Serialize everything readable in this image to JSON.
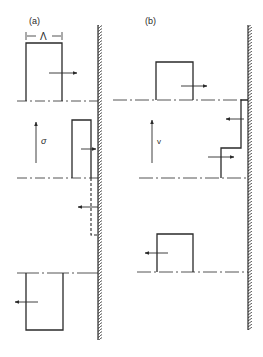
{
  "figure": {
    "panels": [
      {
        "id": "a",
        "label": "(a)",
        "dimension_label": "Λ",
        "velocity_label": "σ",
        "states": [
          {
            "shape": "rectangle",
            "arrow": "right",
            "position": "top"
          },
          {
            "shape": "narrow-rectangle-at-wall",
            "arrow": "right",
            "reflected": "dashed",
            "reflected_arrow": "left",
            "position": "middle"
          },
          {
            "shape": "rectangle",
            "arrow": "left",
            "position": "bottom"
          }
        ]
      },
      {
        "id": "b",
        "label": "(b)",
        "velocity_label": "v",
        "states": [
          {
            "shape": "square",
            "arrow": "right",
            "position": "top"
          },
          {
            "shape": "step-profile-at-wall",
            "arrows": [
              "left",
              "right"
            ],
            "position": "middle"
          },
          {
            "shape": "square",
            "arrow": "left",
            "position": "bottom"
          }
        ]
      }
    ],
    "colors": {
      "ink": "#2a2a2a",
      "background": "#ffffff"
    }
  }
}
